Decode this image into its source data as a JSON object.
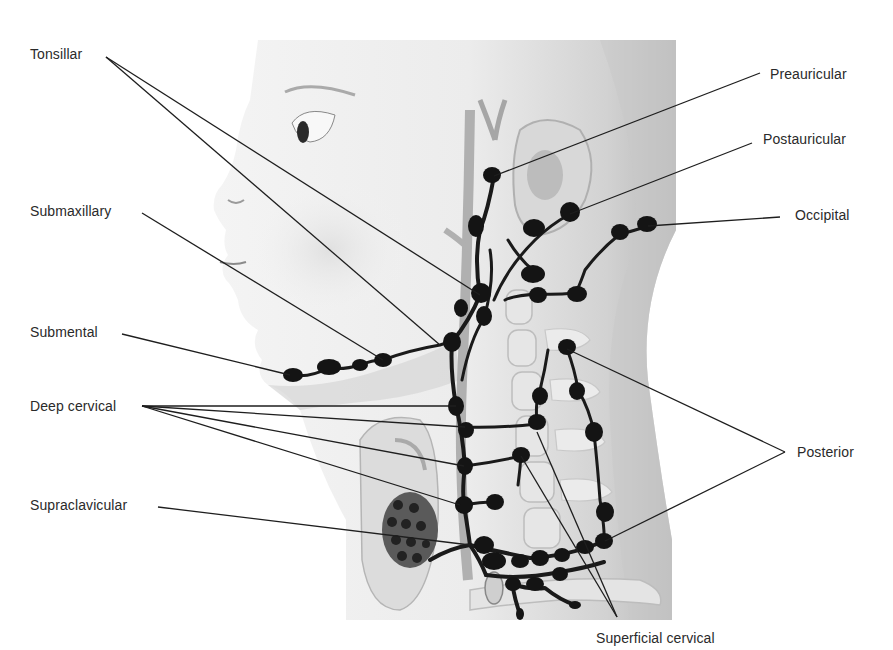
{
  "diagram": {
    "title": "",
    "colors": {
      "background": "#ffffff",
      "text": "#2a2a2a",
      "node": "#141414",
      "leader_line": "#1e1e1e",
      "skin_light": "#f2f2f2",
      "skin_shadow": "#bdbdbd"
    },
    "labels": [
      {
        "id": "tonsillar",
        "text": "Tonsillar",
        "x": 30,
        "y": 46
      },
      {
        "id": "submaxillary",
        "text": "Submaxillary",
        "x": 30,
        "y": 203
      },
      {
        "id": "submental",
        "text": "Submental",
        "x": 30,
        "y": 324
      },
      {
        "id": "deep-cervical",
        "text": "Deep cervical",
        "x": 30,
        "y": 398
      },
      {
        "id": "supraclavicular",
        "text": "Supraclavicular",
        "x": 30,
        "y": 497
      },
      {
        "id": "preauricular",
        "text": "Preauricular",
        "x": 770,
        "y": 66
      },
      {
        "id": "postauricular",
        "text": "Postauricular",
        "x": 763,
        "y": 131
      },
      {
        "id": "occipital",
        "text": "Occipital",
        "x": 795,
        "y": 207
      },
      {
        "id": "posterior",
        "text": "Posterior",
        "x": 797,
        "y": 444
      },
      {
        "id": "superficial-cervical",
        "text": "Superficial cervical",
        "x": 596,
        "y": 630
      }
    ],
    "leader_lines": [
      {
        "label": "tonsillar",
        "points": [
          [
            106,
            57
          ],
          [
            480,
            295
          ]
        ]
      },
      {
        "label": "tonsillar",
        "points": [
          [
            106,
            57
          ],
          [
            440,
            345
          ]
        ]
      },
      {
        "label": "submaxillary",
        "points": [
          [
            142,
            213
          ],
          [
            383,
            360
          ]
        ]
      },
      {
        "label": "submental",
        "points": [
          [
            122,
            334
          ],
          [
            290,
            375
          ]
        ]
      },
      {
        "label": "deep-cervical",
        "points": [
          [
            142,
            406
          ],
          [
            456,
            406
          ]
        ]
      },
      {
        "label": "deep-cervical",
        "points": [
          [
            142,
            406
          ],
          [
            465,
            427
          ]
        ]
      },
      {
        "label": "deep-cervical",
        "points": [
          [
            142,
            406
          ],
          [
            464,
            466
          ]
        ]
      },
      {
        "label": "deep-cervical",
        "points": [
          [
            142,
            406
          ],
          [
            460,
            505
          ]
        ]
      },
      {
        "label": "supraclavicular",
        "points": [
          [
            158,
            507
          ],
          [
            470,
            545
          ]
        ]
      },
      {
        "label": "preauricular",
        "points": [
          [
            760,
            73
          ],
          [
            494,
            176
          ]
        ]
      },
      {
        "label": "postauricular",
        "points": [
          [
            752,
            143
          ],
          [
            570,
            214
          ]
        ]
      },
      {
        "label": "occipital",
        "points": [
          [
            780,
            217
          ],
          [
            648,
            226
          ]
        ]
      },
      {
        "label": "posterior",
        "points": [
          [
            785,
            452
          ],
          [
            567,
            349
          ]
        ]
      },
      {
        "label": "posterior",
        "points": [
          [
            785,
            452
          ],
          [
            605,
            541
          ]
        ]
      },
      {
        "label": "superficial-cervical",
        "points": [
          [
            617,
            617
          ],
          [
            537,
            432
          ]
        ]
      },
      {
        "label": "superficial-cervical",
        "points": [
          [
            617,
            617
          ],
          [
            521,
            456
          ]
        ]
      }
    ]
  }
}
